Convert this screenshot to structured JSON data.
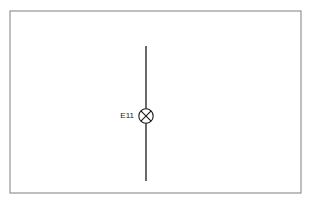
{
  "diagram": {
    "canvas": {
      "width": 311,
      "height": 208,
      "background": "#ffffff"
    },
    "frame": {
      "x": 10,
      "y": 11,
      "width": 291,
      "height": 182,
      "stroke": "#8a8a8a"
    },
    "grid": {
      "columns": 15,
      "rows": 9,
      "cell_width": 19.4,
      "cell_height": 20.2,
      "color": "#dcdcdc",
      "visible": true
    },
    "wire": {
      "orientation": "vertical",
      "x": 146,
      "y_top": 46,
      "y_bottom": 181,
      "color": "#1a1a1a"
    },
    "components": [
      {
        "id": "E11",
        "label": "E11",
        "symbol": "lamp-crossed-circle",
        "cx": 146,
        "cy": 116,
        "radius": 7.2,
        "label_x": 134,
        "label_y": 116,
        "color": "#1a1a1a"
      }
    ]
  }
}
